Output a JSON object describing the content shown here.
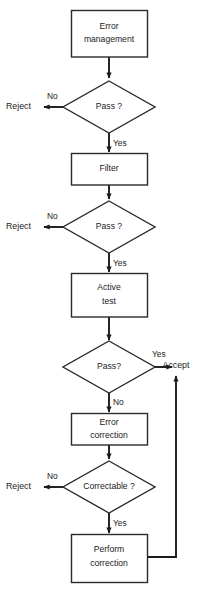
{
  "diagram": {
    "type": "flowchart",
    "background_color": "#ffffff",
    "line_color": "#1b1b1b",
    "text_color": "#1b1b1b",
    "nodes": [
      {
        "id": "error_management",
        "shape": "process",
        "lines": [
          "Error",
          "management"
        ]
      },
      {
        "id": "pass_1",
        "shape": "decision",
        "lines": [
          "Pass ?"
        ]
      },
      {
        "id": "filter",
        "shape": "process",
        "lines": [
          "Filter"
        ]
      },
      {
        "id": "pass_2",
        "shape": "decision",
        "lines": [
          "Pass ?"
        ]
      },
      {
        "id": "active_test",
        "shape": "process",
        "lines": [
          "Active",
          "test"
        ]
      },
      {
        "id": "pass_3",
        "shape": "decision",
        "lines": [
          "Pass?"
        ]
      },
      {
        "id": "error_correction",
        "shape": "process",
        "lines": [
          "Error",
          "correction"
        ]
      },
      {
        "id": "correctable",
        "shape": "decision",
        "lines": [
          "Correctable ?"
        ]
      },
      {
        "id": "perform_correction",
        "shape": "process",
        "lines": [
          "Perform",
          "correction"
        ]
      }
    ],
    "terminals": [
      {
        "id": "reject_1",
        "label": "Reject"
      },
      {
        "id": "reject_2",
        "label": "Reject"
      },
      {
        "id": "reject_3",
        "label": "Reject"
      },
      {
        "id": "accept",
        "label": "Accept"
      }
    ],
    "edge_labels": [
      {
        "id": "pass1_no",
        "label": "No"
      },
      {
        "id": "pass1_yes",
        "label": "Yes"
      },
      {
        "id": "pass2_no",
        "label": "No"
      },
      {
        "id": "pass2_yes",
        "label": "Yes"
      },
      {
        "id": "pass3_yes",
        "label": "Yes"
      },
      {
        "id": "pass3_no",
        "label": "No"
      },
      {
        "id": "correctable_no",
        "label": "No"
      },
      {
        "id": "correctable_yes",
        "label": "Yes"
      }
    ],
    "caption": ""
  }
}
